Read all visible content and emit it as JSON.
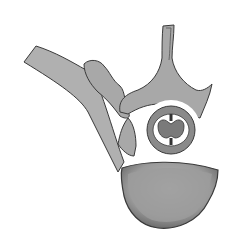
{
  "figure": {
    "colors": {
      "background": "#ffffff",
      "bone": "#a8a8a8",
      "bone_light": "#c4c4c4",
      "outline": "#3a3a3a",
      "body_shade": "#8c8c8c",
      "cord": "#7a7a7a",
      "canal_white": "#ffffff"
    }
  }
}
